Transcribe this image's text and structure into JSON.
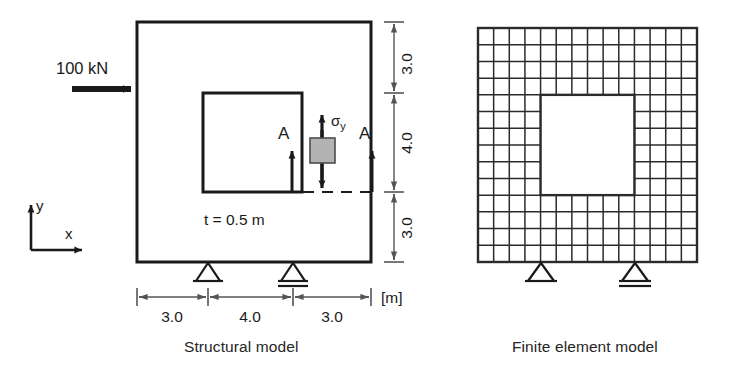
{
  "figure": {
    "panels": [
      {
        "id": "structural-model",
        "caption": "Structural model",
        "labels": {
          "load": "100 kN",
          "thickness": "t = 0.5 m",
          "stress": "σ",
          "stress_subscript": "y",
          "section_left": "A",
          "section_right": "A",
          "axis_x": "x",
          "axis_y": "y",
          "unit": "[m]"
        },
        "dimensions": {
          "horizontal": [
            "3.0",
            "4.0",
            "3.0"
          ],
          "vertical": [
            "3.0",
            "4.0",
            "3.0"
          ]
        },
        "geometry": {
          "outer_width_m": 10.0,
          "outer_height_m": 10.0,
          "hole_width_m": 4.0,
          "hole_height_m": 4.0,
          "thickness_m": 0.5,
          "load_kN": 100
        },
        "supports": [
          {
            "type": "pin-support",
            "position_m": 3.0
          },
          {
            "type": "roller-support",
            "position_m": 7.0
          }
        ]
      },
      {
        "id": "finite-element-model",
        "caption": "Finite element model",
        "mesh": {
          "columns": 14,
          "rows": 14,
          "hole_col_start": 4,
          "hole_col_end": 10,
          "hole_row_start": 4,
          "hole_row_end": 10
        },
        "supports": [
          {
            "type": "pin-support",
            "column": 4
          },
          {
            "type": "roller-support",
            "column": 10
          }
        ]
      }
    ],
    "colors": {
      "line": "#1a1a1a",
      "mesh_line": "#2b2b2b",
      "dimension_line": "#555555",
      "stress_element_fill": "#b3b3b3",
      "background": "#ffffff"
    }
  }
}
